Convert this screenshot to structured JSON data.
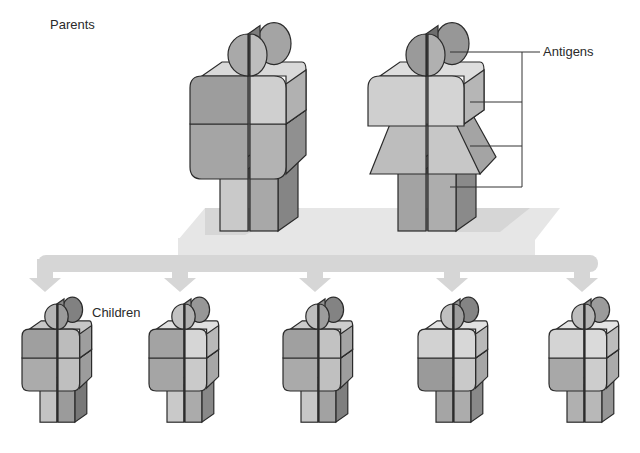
{
  "labels": {
    "parents": "Parents",
    "antigens": "Antigens",
    "children": "Children"
  },
  "colors": {
    "outline": "#2b2b2b",
    "platform": "#e6e6e6",
    "platform_shadow": "#cfcfcf",
    "arrow": "#d6d6d6",
    "bracket": "#333333"
  },
  "antigen_bracket": {
    "x": 522,
    "label_tick_end": 540,
    "levels_y": [
      52,
      102,
      146,
      187
    ],
    "left_ends_x": [
      450,
      470,
      470,
      450
    ]
  },
  "parents": [
    {
      "id": "father",
      "type": "male",
      "x": 190,
      "y": 14,
      "scale": 1.0,
      "shades": {
        "head_left": "#a9a9a9",
        "head_right": "#bdbdbd",
        "torso_left": "#9d9d9d",
        "torso_right": "#cfcfcf",
        "waist_left": "#a5a5a5",
        "waist_right": "#b3b3b3",
        "legs_left": "#c9c9c9",
        "legs_right": "#a8a8a8"
      }
    },
    {
      "id": "mother",
      "type": "female",
      "x": 368,
      "y": 14,
      "scale": 1.0,
      "shades": {
        "head_left": "#9a9a9a",
        "head_right": "#b0b0b0",
        "torso_left": "#cfcfcf",
        "torso_right": "#d4d4d4",
        "waist_left": "#bdbdbd",
        "waist_right": "#c7c7c7",
        "legs_left": "#a3a3a3",
        "legs_right": "#adadad"
      }
    }
  ],
  "children": [
    {
      "id": "child-1",
      "x": 22,
      "y": 292,
      "scale": 0.6,
      "shades": {
        "head_left": "#b5b5b5",
        "head_right": "#9a9a9a",
        "torso_left": "#9f9f9f",
        "torso_right": "#bcbcbc",
        "waist_left": "#ababab",
        "waist_right": "#bfbfbf",
        "legs_left": "#c3c3c3",
        "legs_right": "#9b9b9b"
      }
    },
    {
      "id": "child-2",
      "x": 149,
      "y": 292,
      "scale": 0.6,
      "shades": {
        "head_left": "#c2c2c2",
        "head_right": "#b0b0b0",
        "torso_left": "#a3a3a3",
        "torso_right": "#d6d6d6",
        "waist_left": "#a5a5a5",
        "waist_right": "#cacaca",
        "legs_left": "#c9c9c9",
        "legs_right": "#ababab"
      }
    },
    {
      "id": "child-3",
      "x": 283,
      "y": 292,
      "scale": 0.6,
      "shades": {
        "head_left": "#bdbdbd",
        "head_right": "#9c9c9c",
        "torso_left": "#a0a0a0",
        "torso_right": "#c2c2c2",
        "waist_left": "#aaaaaa",
        "waist_right": "#c0c0c0",
        "legs_left": "#c7c7c7",
        "legs_right": "#a2a2a2"
      }
    },
    {
      "id": "child-4",
      "x": 418,
      "y": 292,
      "scale": 0.6,
      "shades": {
        "head_left": "#c0c0c0",
        "head_right": "#9d9d9d",
        "torso_left": "#d2d2d2",
        "torso_right": "#d7d7d7",
        "waist_left": "#9a9a9a",
        "waist_right": "#c9c9c9",
        "legs_left": "#a5a5a5",
        "legs_right": "#acacac"
      }
    },
    {
      "id": "child-5",
      "x": 549,
      "y": 292,
      "scale": 0.6,
      "shades": {
        "head_left": "#bdbdbd",
        "head_right": "#b4b4b4",
        "torso_left": "#d4d4d4",
        "torso_right": "#dadada",
        "waist_left": "#a8a8a8",
        "waist_right": "#cdcdcd",
        "legs_left": "#b0b0b0",
        "legs_right": "#b8b8b8"
      }
    }
  ],
  "arrows": {
    "bar_y": 255,
    "bar_h": 17,
    "bar_x1": 38,
    "bar_x2": 598,
    "tips_x": [
      45,
      180,
      315,
      452,
      582
    ],
    "tip_y": 292
  },
  "platform": {
    "points": "178,240 205,208 560,208 535,240"
  }
}
